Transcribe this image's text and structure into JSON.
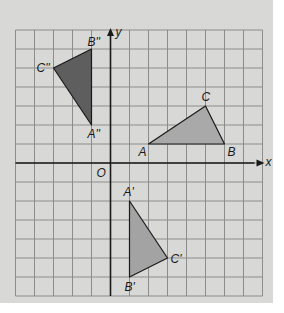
{
  "diagram": {
    "type": "coordinate-grid-transformations",
    "grid": {
      "x_min": -5,
      "x_max": 8,
      "y_min": -7,
      "y_max": 7,
      "cell_px": 19,
      "origin_px": [
        110.5,
        163
      ]
    },
    "axes": {
      "x_label": "x",
      "y_label": "y",
      "origin_label": "O"
    },
    "colors": {
      "panel": "#d8d8d6",
      "grid_line": "#8c8c8c",
      "axis": "#1a1a1a",
      "triangle_abc_fill": "#a9a9a9",
      "triangle_prime_fill": "#a3a3a3",
      "triangle_double_prime_fill": "#5e5e5e"
    },
    "triangles": [
      {
        "name": "ABC",
        "vertices": [
          {
            "label": "A",
            "x": 2,
            "y": 1
          },
          {
            "label": "B",
            "x": 6,
            "y": 1
          },
          {
            "label": "C",
            "x": 5,
            "y": 3
          }
        ]
      },
      {
        "name": "A'B'C'",
        "vertices": [
          {
            "label": "A'",
            "x": 1,
            "y": -2
          },
          {
            "label": "B'",
            "x": 1,
            "y": -6
          },
          {
            "label": "C'",
            "x": 3,
            "y": -5
          }
        ]
      },
      {
        "name": "A''B''C''",
        "vertices": [
          {
            "label": "A''",
            "x": -1,
            "y": 2
          },
          {
            "label": "B''",
            "x": -1,
            "y": 6
          },
          {
            "label": "C''",
            "x": -3,
            "y": 5
          }
        ]
      }
    ]
  }
}
